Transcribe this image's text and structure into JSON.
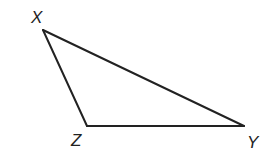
{
  "figure": {
    "type": "triangle",
    "stroke_color": "#222222",
    "background": "#ffffff",
    "vertices": [
      {
        "name": "X",
        "label": "X",
        "x": 43,
        "y": 30,
        "label_x": 31,
        "label_y": 23
      },
      {
        "name": "Z",
        "label": "Z",
        "x": 87,
        "y": 126,
        "label_x": 71,
        "label_y": 146
      },
      {
        "name": "Y",
        "label": "Y",
        "x": 244,
        "y": 126,
        "label_x": 247,
        "label_y": 148
      }
    ],
    "edges": [
      {
        "from": "X",
        "to": "Y",
        "label": "XY"
      },
      {
        "from": "Y",
        "to": "Z",
        "label": "YZ"
      },
      {
        "from": "Z",
        "to": "X",
        "label": "ZX"
      }
    ]
  }
}
